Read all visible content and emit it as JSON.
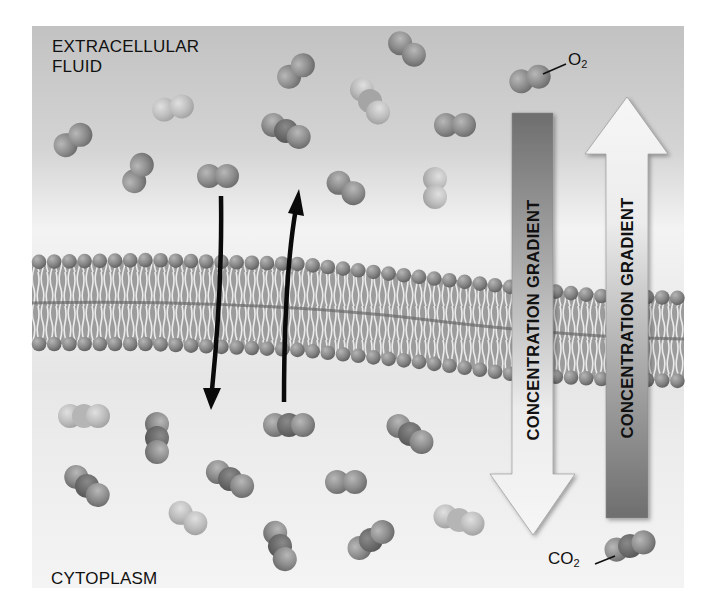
{
  "diagram": {
    "regions": {
      "extracellular_label_line1": "EXTRACELLULAR",
      "extracellular_label_line2": "FLUID",
      "cytoplasm_label": "CYTOPLASM"
    },
    "molecule_labels": {
      "oxygen": {
        "base": "O",
        "subscript": "2"
      },
      "carbon_dioxide": {
        "base": "CO",
        "subscript": "2"
      }
    },
    "gradient_arrows": [
      {
        "id": "o2-gradient",
        "label": "CONCENTRATION GRADIENT",
        "direction": "down",
        "meaning": "O2 moves from extracellular fluid into cytoplasm"
      },
      {
        "id": "co2-gradient",
        "label": "CONCENTRATION GRADIENT",
        "direction": "up",
        "meaning": "CO2 moves from cytoplasm into extracellular fluid"
      }
    ],
    "transport_arrows": [
      {
        "id": "o2-entry-arrow",
        "direction": "down"
      },
      {
        "id": "co2-exit-arrow",
        "direction": "up"
      }
    ],
    "colors": {
      "panel_top": "#c4c4c4",
      "panel_bottom": "#efefef",
      "membrane_head": "#8a8a8a",
      "membrane_tail": "#f2f2f2",
      "arrow_dark": "#757575",
      "arrow_light": "#f4f4f4",
      "text": "#111111"
    }
  }
}
